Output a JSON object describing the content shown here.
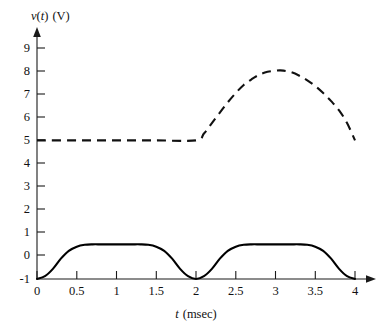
{
  "chart_data": {
    "type": "line",
    "title": "",
    "xlabel": "t (msec)",
    "xlabel_italic_part": "t",
    "xlabel_roman_part": "(msec)",
    "ylabel": "v(t) (V)",
    "ylabel_italic_v": "v",
    "ylabel_paren_t": "(t)",
    "ylabel_italic_t": "t",
    "ylabel_unit": "(V)",
    "xlim": [
      0,
      4
    ],
    "ylim": [
      -1,
      9
    ],
    "grid": false,
    "legend": "none",
    "xticks": [
      "0",
      "0.5",
      "1",
      "1.5",
      "2",
      "2.5",
      "3",
      "3.5",
      "4"
    ],
    "xtick_values": [
      0,
      0.5,
      1,
      1.5,
      2,
      2.5,
      3,
      3.5,
      4
    ],
    "yticks": [
      "9",
      "8",
      "7",
      "6",
      "5",
      "4",
      "3",
      "2",
      "1",
      "0",
      "-1"
    ],
    "ytick_values": [
      9,
      8,
      7,
      6,
      5,
      4,
      3,
      2,
      1,
      0,
      -1
    ],
    "series": [
      {
        "name": "input-rectified-sine",
        "style": "solid",
        "color": "#000000",
        "description": "Full-wave rectified sine offset, two humps peaking at 0.5 V",
        "x": [
          0,
          0.1,
          0.2,
          0.3,
          0.4,
          0.5,
          0.6,
          0.7,
          0.8,
          0.9,
          1,
          1.1,
          1.2,
          1.3,
          1.4,
          1.5,
          1.6,
          1.7,
          1.8,
          1.9,
          2,
          2.1,
          2.2,
          2.3,
          2.4,
          2.5,
          2.6,
          2.7,
          2.8,
          2.9,
          3,
          3.1,
          3.2,
          3.3,
          3.4,
          3.5,
          3.6,
          3.7,
          3.8,
          3.9,
          4
        ],
        "y": [
          -1,
          -0.88,
          -0.56,
          -0.12,
          0.22,
          0.4,
          0.48,
          0.5,
          0.5,
          0.5,
          0.5,
          0.5,
          0.5,
          0.5,
          0.48,
          0.4,
          0.22,
          -0.12,
          -0.56,
          -0.88,
          -1,
          -0.88,
          -0.56,
          -0.12,
          0.22,
          0.4,
          0.48,
          0.5,
          0.5,
          0.5,
          0.5,
          0.5,
          0.5,
          0.5,
          0.48,
          0.4,
          0.22,
          -0.12,
          -0.56,
          -0.88,
          -1
        ]
      },
      {
        "name": "output-response",
        "style": "dashed",
        "color": "#111111",
        "description": "Constant 5 V until t = 2 msec, rises to peak 8 V near t = 3 msec, then decays back to 5 V at t = 4 msec",
        "x": [
          0,
          0.5,
          1,
          1.5,
          2,
          2.1,
          2.2,
          2.3,
          2.4,
          2.5,
          2.6,
          2.7,
          2.8,
          2.9,
          3,
          3.05,
          3.1,
          3.2,
          3.3,
          3.4,
          3.5,
          3.6,
          3.7,
          3.8,
          3.9,
          4
        ],
        "y": [
          5,
          5,
          5,
          5,
          5,
          5.3,
          5.75,
          6.2,
          6.65,
          7.05,
          7.4,
          7.65,
          7.85,
          7.97,
          8.02,
          8.03,
          8.02,
          7.95,
          7.8,
          7.6,
          7.35,
          7.05,
          6.7,
          6.3,
          5.75,
          5.0
        ]
      }
    ]
  },
  "figure": {
    "caption": ""
  }
}
